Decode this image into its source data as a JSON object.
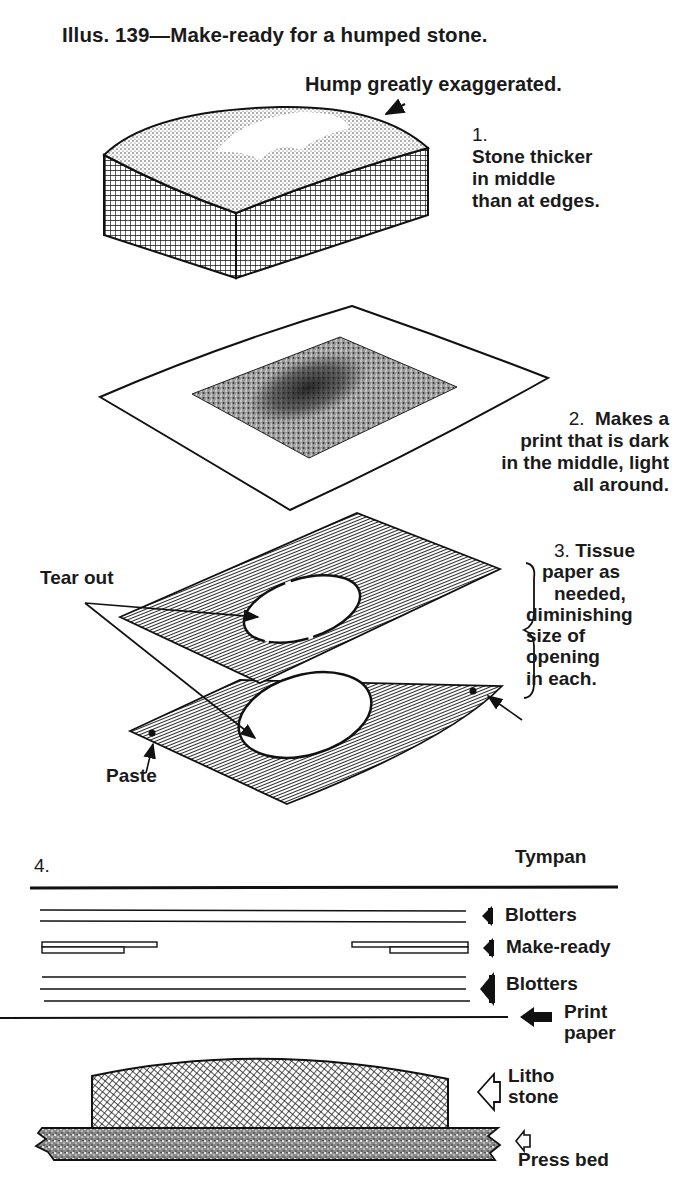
{
  "figure": {
    "title": "Illus. 139—Make-ready for a humped stone.",
    "colors": {
      "ink": "#1a1a1a",
      "paper": "#ffffff"
    }
  },
  "step1": {
    "callout": "Hump greatly exaggerated.",
    "number": "1.",
    "lines": [
      "Stone thicker",
      "in middle",
      "than at edges."
    ]
  },
  "step2": {
    "number": "2.",
    "first_line": "Makes a",
    "lines": [
      "print that is dark",
      "in the middle, light",
      "all around."
    ]
  },
  "step3": {
    "number": "3.",
    "first_line": "Tissue",
    "lines": [
      "paper as",
      "needed,",
      "diminishing",
      "size of",
      "opening",
      "in each."
    ],
    "tear_label": "Tear out",
    "paste_label": "Paste"
  },
  "step4": {
    "number": "4.",
    "layers": {
      "tympan": "Tympan",
      "blotters_top": "Blotters",
      "make_ready": "Make-ready",
      "blotters_bottom": "Blotters",
      "print_paper_line1": "Print",
      "print_paper_line2": "paper",
      "litho_stone_line1": "Litho",
      "litho_stone_line2": "stone",
      "press_bed": "Press bed"
    }
  }
}
